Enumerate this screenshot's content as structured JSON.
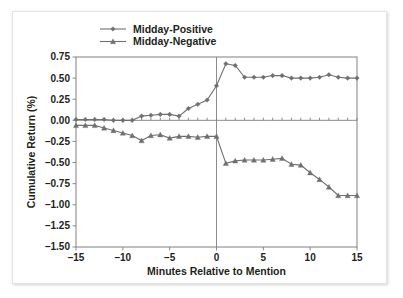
{
  "chart_data": {
    "type": "line",
    "title": "",
    "subtitle": "",
    "xlabel": "Minutes Relative to Mention",
    "ylabel": "Cumulative Return (%)",
    "xlim": [
      -15,
      15
    ],
    "ylim": [
      -1.5,
      0.75
    ],
    "xticks": [
      -15,
      -10,
      -5,
      0,
      5,
      10,
      15
    ],
    "xtick_labels": [
      "–15",
      "–10",
      "–5",
      "0",
      "5",
      "10",
      "15"
    ],
    "yticks": [
      0.75,
      0.5,
      0.25,
      0.0,
      -0.25,
      -0.5,
      -0.75,
      -1.0,
      -1.25,
      -1.5
    ],
    "ytick_labels": [
      "0.75",
      "0.50",
      "0.25",
      "0.00",
      "–0.25",
      "–0.50",
      "–0.75",
      "–1.00",
      "–1.25",
      "–1.50"
    ],
    "grid": false,
    "legend_position": "top-center",
    "reference_lines": [
      {
        "axis": "x",
        "value": 0
      },
      {
        "axis": "y",
        "value": 0
      }
    ],
    "x": [
      -15,
      -14,
      -13,
      -12,
      -11,
      -10,
      -9,
      -8,
      -7,
      -6,
      -5,
      -4,
      -3,
      -2,
      -1,
      0,
      1,
      2,
      3,
      4,
      5,
      6,
      7,
      8,
      9,
      10,
      11,
      12,
      13,
      14,
      15
    ],
    "series": [
      {
        "name": "Midday-Positive",
        "marker": "diamond",
        "color": "#6f6f72",
        "values": [
          0.01,
          0.01,
          0.01,
          0.01,
          0.0,
          0.0,
          0.0,
          0.05,
          0.06,
          0.07,
          0.07,
          0.05,
          0.14,
          0.19,
          0.24,
          0.41,
          0.67,
          0.65,
          0.51,
          0.51,
          0.51,
          0.53,
          0.53,
          0.5,
          0.5,
          0.5,
          0.51,
          0.54,
          0.51,
          0.5,
          0.5
        ]
      },
      {
        "name": "Midday-Negative",
        "marker": "triangle",
        "color": "#6f6f72",
        "values": [
          -0.06,
          -0.06,
          -0.06,
          -0.09,
          -0.12,
          -0.15,
          -0.18,
          -0.24,
          -0.18,
          -0.17,
          -0.21,
          -0.19,
          -0.19,
          -0.2,
          -0.19,
          -0.19,
          -0.51,
          -0.48,
          -0.47,
          -0.47,
          -0.47,
          -0.46,
          -0.45,
          -0.52,
          -0.53,
          -0.62,
          -0.7,
          -0.79,
          -0.89,
          -0.89,
          -0.89
        ]
      }
    ],
    "legend": [
      {
        "label": "Midday-Positive",
        "marker": "diamond"
      },
      {
        "label": "Midday-Negative",
        "marker": "triangle"
      }
    ]
  }
}
